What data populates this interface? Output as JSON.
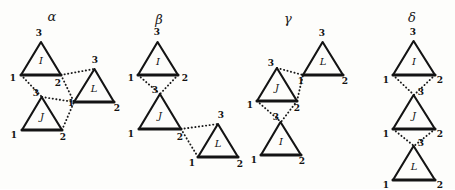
{
  "figure": {
    "background_color": "#fdfdfb",
    "ink_color": "#141414",
    "vertex_labels": [
      "1",
      "2",
      "3"
    ],
    "triangle_names": [
      "I",
      "J",
      "L"
    ],
    "panels": [
      {
        "id": "alpha",
        "label": "α",
        "label_x": 52,
        "label_y": 17,
        "triangles": [
          {
            "name": "I",
            "cx": 41,
            "cy": 57,
            "size": 30,
            "rot": 0,
            "name_x": 41,
            "name_y": 61,
            "vertices": [
              {
                "num": "1",
                "x": 21,
                "y": 75,
                "lx": 13,
                "ly": 78
              },
              {
                "num": "2",
                "x": 61,
                "y": 75,
                "lx": 58,
                "ly": 83
              },
              {
                "num": "3",
                "x": 41,
                "y": 42,
                "lx": 39,
                "ly": 33
              }
            ]
          },
          {
            "name": "J",
            "cx": 42,
            "cy": 113,
            "size": 30,
            "rot": 0,
            "name_x": 42,
            "name_y": 117,
            "vertices": [
              {
                "num": "1",
                "x": 22,
                "y": 130,
                "lx": 14,
                "ly": 135
              },
              {
                "num": "2",
                "x": 62,
                "y": 130,
                "lx": 63,
                "ly": 137
              },
              {
                "num": "3",
                "x": 42,
                "y": 97,
                "lx": 36,
                "ly": 93
              }
            ]
          },
          {
            "name": "L",
            "cx": 94,
            "cy": 85,
            "size": 30,
            "rot": 0,
            "name_x": 94,
            "name_y": 89,
            "vertices": [
              {
                "num": "1",
                "x": 74,
                "y": 102,
                "lx": 71,
                "ly": 103
              },
              {
                "num": "2",
                "x": 114,
                "y": 102,
                "lx": 117,
                "ly": 108
              },
              {
                "num": "3",
                "x": 94,
                "y": 69,
                "lx": 95,
                "ly": 60
              }
            ]
          }
        ],
        "links": [
          {
            "x1": 21,
            "y1": 75,
            "x2": 42,
            "y2": 97
          },
          {
            "x1": 61,
            "y1": 75,
            "x2": 74,
            "y2": 102
          },
          {
            "x1": 61,
            "y1": 75,
            "x2": 94,
            "y2": 69
          },
          {
            "x1": 62,
            "y1": 130,
            "x2": 74,
            "y2": 102
          },
          {
            "x1": 42,
            "y1": 97,
            "x2": 74,
            "y2": 102
          }
        ]
      },
      {
        "id": "beta",
        "label": "β",
        "label_x": 159,
        "label_y": 20,
        "triangles": [
          {
            "name": "I",
            "cx": 158,
            "cy": 58,
            "size": 30,
            "rot": 0,
            "name_x": 158,
            "name_y": 62,
            "vertices": [
              {
                "num": "1",
                "x": 138,
                "y": 75,
                "lx": 131,
                "ly": 78
              },
              {
                "num": "2",
                "x": 178,
                "y": 75,
                "lx": 185,
                "ly": 78
              },
              {
                "num": "3",
                "x": 158,
                "y": 42,
                "lx": 157,
                "ly": 32
              }
            ]
          },
          {
            "name": "J",
            "cx": 160,
            "cy": 112,
            "size": 32,
            "rot": 0,
            "name_x": 160,
            "name_y": 116,
            "vertices": [
              {
                "num": "1",
                "x": 139,
                "y": 129,
                "lx": 131,
                "ly": 134
              },
              {
                "num": "2",
                "x": 181,
                "y": 129,
                "lx": 180,
                "ly": 137
              },
              {
                "num": "3",
                "x": 160,
                "y": 94,
                "lx": 155,
                "ly": 90
              }
            ]
          },
          {
            "name": "L",
            "cx": 218,
            "cy": 140,
            "size": 30,
            "rot": 0,
            "name_x": 218,
            "name_y": 144,
            "vertices": [
              {
                "num": "1",
                "x": 198,
                "y": 157,
                "lx": 192,
                "ly": 163
              },
              {
                "num": "2",
                "x": 238,
                "y": 157,
                "lx": 240,
                "ly": 164
              },
              {
                "num": "3",
                "x": 218,
                "y": 124,
                "lx": 221,
                "ly": 115
              }
            ]
          }
        ],
        "links": [
          {
            "x1": 138,
            "y1": 75,
            "x2": 160,
            "y2": 94
          },
          {
            "x1": 178,
            "y1": 75,
            "x2": 160,
            "y2": 94
          },
          {
            "x1": 181,
            "y1": 129,
            "x2": 218,
            "y2": 124
          },
          {
            "x1": 181,
            "y1": 129,
            "x2": 198,
            "y2": 157
          }
        ]
      },
      {
        "id": "gamma",
        "label": "γ",
        "label_x": 288,
        "label_y": 19,
        "triangles": [
          {
            "name": "L",
            "cx": 323,
            "cy": 58,
            "size": 30,
            "rot": 0,
            "name_x": 323,
            "name_y": 62,
            "vertices": [
              {
                "num": "1",
                "x": 303,
                "y": 75,
                "lx": 301,
                "ly": 81
              },
              {
                "num": "2",
                "x": 343,
                "y": 75,
                "lx": 345,
                "ly": 81
              },
              {
                "num": "3",
                "x": 323,
                "y": 42,
                "lx": 322,
                "ly": 33
              }
            ]
          },
          {
            "name": "J",
            "cx": 277,
            "cy": 84,
            "size": 31,
            "rot": 0,
            "name_x": 277,
            "name_y": 88,
            "vertices": [
              {
                "num": "1",
                "x": 257,
                "y": 101,
                "lx": 250,
                "ly": 105
              },
              {
                "num": "2",
                "x": 297,
                "y": 101,
                "lx": 297,
                "ly": 108
              },
              {
                "num": "3",
                "x": 277,
                "y": 68,
                "lx": 271,
                "ly": 63
              }
            ]
          },
          {
            "name": "I",
            "cx": 281,
            "cy": 138,
            "size": 30,
            "rot": 0,
            "name_x": 281,
            "name_y": 142,
            "vertices": [
              {
                "num": "1",
                "x": 261,
                "y": 155,
                "lx": 254,
                "ly": 160
              },
              {
                "num": "2",
                "x": 301,
                "y": 155,
                "lx": 302,
                "ly": 161
              },
              {
                "num": "3",
                "x": 281,
                "y": 122,
                "lx": 276,
                "ly": 117
              }
            ]
          }
        ],
        "links": [
          {
            "x1": 277,
            "y1": 68,
            "x2": 303,
            "y2": 75
          },
          {
            "x1": 297,
            "y1": 101,
            "x2": 303,
            "y2": 75
          },
          {
            "x1": 257,
            "y1": 101,
            "x2": 281,
            "y2": 122
          },
          {
            "x1": 297,
            "y1": 101,
            "x2": 281,
            "y2": 122
          }
        ]
      },
      {
        "id": "delta",
        "label": "δ",
        "label_x": 412,
        "label_y": 18,
        "triangles": [
          {
            "name": "I",
            "cx": 414,
            "cy": 58,
            "size": 31,
            "rot": 0,
            "name_x": 414,
            "name_y": 62,
            "vertices": [
              {
                "num": "1",
                "x": 393,
                "y": 75,
                "lx": 386,
                "ly": 80
              },
              {
                "num": "2",
                "x": 435,
                "y": 75,
                "lx": 440,
                "ly": 80
              },
              {
                "num": "3",
                "x": 414,
                "y": 41,
                "lx": 413,
                "ly": 32
              }
            ]
          },
          {
            "name": "J",
            "cx": 414,
            "cy": 112,
            "size": 31,
            "rot": 0,
            "name_x": 414,
            "name_y": 116,
            "vertices": [
              {
                "num": "1",
                "x": 393,
                "y": 129,
                "lx": 386,
                "ly": 134
              },
              {
                "num": "2",
                "x": 435,
                "y": 129,
                "lx": 440,
                "ly": 134
              },
              {
                "num": "3",
                "x": 414,
                "y": 95,
                "lx": 421,
                "ly": 92
              }
            ]
          },
          {
            "name": "L",
            "cx": 414,
            "cy": 163,
            "size": 31,
            "rot": 0,
            "name_x": 414,
            "name_y": 167,
            "vertices": [
              {
                "num": "1",
                "x": 393,
                "y": 180,
                "lx": 386,
                "ly": 185
              },
              {
                "num": "2",
                "x": 435,
                "y": 180,
                "lx": 440,
                "ly": 185
              },
              {
                "num": "3",
                "x": 414,
                "y": 146,
                "lx": 421,
                "ly": 143
              }
            ]
          }
        ],
        "links": [
          {
            "x1": 393,
            "y1": 75,
            "x2": 414,
            "y2": 95
          },
          {
            "x1": 435,
            "y1": 75,
            "x2": 414,
            "y2": 95
          },
          {
            "x1": 393,
            "y1": 129,
            "x2": 414,
            "y2": 146
          },
          {
            "x1": 435,
            "y1": 129,
            "x2": 414,
            "y2": 146
          }
        ]
      }
    ]
  }
}
